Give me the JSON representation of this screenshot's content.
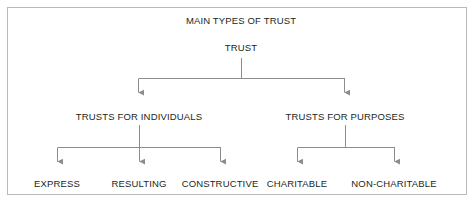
{
  "diagram": {
    "title": "MAIN TYPES OF TRUST",
    "root": {
      "label": "TRUST"
    },
    "branches": [
      {
        "label": "TRUSTS FOR INDIVIDUALS",
        "children": [
          {
            "label": "EXPRESS"
          },
          {
            "label": "RESULTING"
          },
          {
            "label": "CONSTRUCTIVE"
          }
        ]
      },
      {
        "label": "TRUSTS FOR PURPOSES",
        "children": [
          {
            "label": "CHARITABLE"
          },
          {
            "label": "NON-CHARITABLE"
          }
        ]
      }
    ],
    "colors": {
      "text": "#231f20",
      "connector": "#8c8c8c",
      "frame_border": "#b9b9b9",
      "background": "#ffffff"
    }
  }
}
